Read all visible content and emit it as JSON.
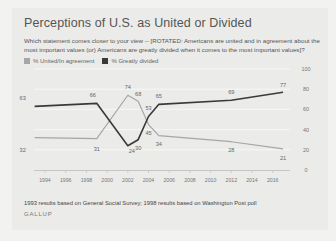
{
  "header": {
    "title": "Perceptions of U.S. as United or Divided",
    "subtitle": "Which statement comes closer to your view -- [ROTATED: Americans are united and in agreement about the most important values (or) Americans are greatly divided when it comes to the most important values]?"
  },
  "legend": [
    {
      "label": "% United/In agreement",
      "color": "#a6a6a6"
    },
    {
      "label": "% Greatly divided",
      "color": "#3a3a3a"
    }
  ],
  "footer": {
    "note": "1993 results based on General Social Survey; 1998 results based on Washington Post poll",
    "brand": "GALLUP"
  },
  "chart_data": {
    "type": "line",
    "title": "Perceptions of U.S. as United or Divided",
    "xlabel": "",
    "ylabel": "",
    "x": [
      1993,
      1999,
      2002,
      2003,
      2004,
      2005,
      2012,
      2017
    ],
    "x_ticks": [
      "1994",
      "1996",
      "1998",
      "2000",
      "2002",
      "2004",
      "2006",
      "2008",
      "2010",
      "2012",
      "2014",
      "2016"
    ],
    "y_ticks": [
      0,
      20,
      40,
      60,
      80,
      100
    ],
    "ylim": [
      0,
      100
    ],
    "grid": true,
    "legend_position": "top-left",
    "series": [
      {
        "name": "% United/In agreement",
        "color": "#a6a6a6",
        "values": [
          32,
          31,
          74,
          68,
          45,
          34,
          28,
          21
        ]
      },
      {
        "name": "% Greatly divided",
        "color": "#3a3a3a",
        "values": [
          63,
          66,
          24,
          30,
          53,
          65,
          69,
          77
        ]
      }
    ]
  }
}
